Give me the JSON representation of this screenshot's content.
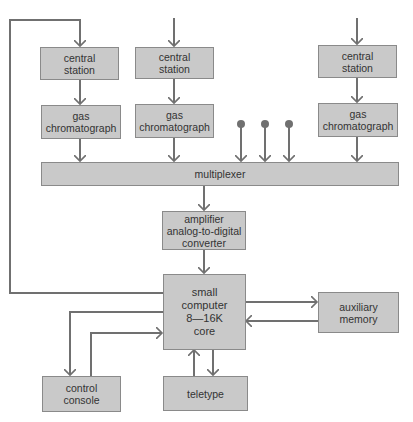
{
  "diagram": {
    "title": "",
    "colors": {
      "box_fill": "#c9c9c9",
      "box_border": "#8a8a8a",
      "line": "#707070",
      "text": "#333333"
    },
    "nodes": {
      "cs1": {
        "label": "central\nstation"
      },
      "cs2": {
        "label": "central\nstation"
      },
      "cs3": {
        "label": "central\nstation"
      },
      "gc1": {
        "label": "gas\nchromatograph"
      },
      "gc2": {
        "label": "gas\nchromatograph"
      },
      "gc3": {
        "label": "gas\nchromatograph"
      },
      "mux": {
        "label": "multiplexer"
      },
      "amp": {
        "label": "amplifier\nanalog-to-digital\nconverter"
      },
      "computer": {
        "label": "small\ncomputer\n8—16K\ncore"
      },
      "aux": {
        "label": "auxiliary\nmemory"
      },
      "console": {
        "label": "control\nconsole"
      },
      "teletype": {
        "label": "teletype"
      }
    },
    "edges": [
      {
        "from": "cs1",
        "to": "gc1"
      },
      {
        "from": "cs2",
        "to": "gc2"
      },
      {
        "from": "cs3",
        "to": "gc3"
      },
      {
        "from": "gc1",
        "to": "mux"
      },
      {
        "from": "gc2",
        "to": "mux"
      },
      {
        "from": "gc3",
        "to": "mux"
      },
      {
        "from": "input-dot-1",
        "to": "mux"
      },
      {
        "from": "input-dot-2",
        "to": "mux"
      },
      {
        "from": "input-dot-3",
        "to": "mux"
      },
      {
        "from": "mux",
        "to": "amp"
      },
      {
        "from": "amp",
        "to": "computer"
      },
      {
        "from": "computer",
        "to": "aux"
      },
      {
        "from": "aux",
        "to": "computer"
      },
      {
        "from": "computer",
        "to": "console"
      },
      {
        "from": "console",
        "to": "computer"
      },
      {
        "from": "computer",
        "to": "teletype"
      },
      {
        "from": "teletype",
        "to": "computer"
      },
      {
        "from": "computer",
        "to": "cs1",
        "note": "feedback loop along left edge"
      }
    ]
  }
}
